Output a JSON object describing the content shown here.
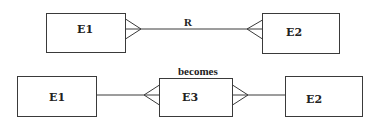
{
  "diagram": {
    "type": "er-diagram",
    "top": {
      "entity_left": {
        "label": "E1"
      },
      "entity_right": {
        "label": "E2"
      },
      "relationship": {
        "label": "R",
        "cardinality": "many-to-many"
      }
    },
    "bottom": {
      "caption": "becomes",
      "entity_left": {
        "label": "E1"
      },
      "entity_middle": {
        "label": "E3"
      },
      "entity_right": {
        "label": "E2"
      }
    },
    "colors": {
      "stroke": "#3a3a3a",
      "text": "#222222",
      "background": "#ffffff"
    }
  }
}
